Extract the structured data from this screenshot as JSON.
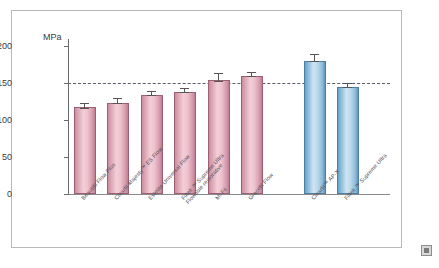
{
  "figure": {
    "corner_icon": "image-placeholder-icon"
  },
  "chart_data": {
    "type": "bar",
    "title": "",
    "xlabel": "",
    "ylabel": "MPa",
    "axis_unit_label": "MPa",
    "ylim": [
      0,
      200
    ],
    "yticks": [
      0,
      50,
      100,
      150,
      200
    ],
    "ytick_labels": [
      "0",
      "50",
      "100",
      "150",
      "200"
    ],
    "grid": false,
    "legend": "none",
    "reference_line": {
      "value": 150,
      "style": "dashed",
      "color": "#5a5a6a",
      "label": ""
    },
    "categories": [
      "Beautifil Flow Plus",
      "Clearfil Majesty™ ES Flow",
      "Estelite Universal Flow",
      "Filtek ™ Supreme Ultra Flowable restorative",
      "MI Fil",
      "Gracefil Flow",
      "Clearfil™ AP-X",
      "Filtek ™ Supreme Ultra"
    ],
    "category_lines": [
      [
        "Beautifil Flow Plus"
      ],
      [
        "Clearfil Majesty™ ES Flow"
      ],
      [
        "Estelite Universal Flow"
      ],
      [
        "Filtek ™ Supreme Ultra",
        "Flowable restorative"
      ],
      [
        "MI Fil"
      ],
      [
        "Gracefil Flow"
      ],
      [
        "Clearfil™ AP-X"
      ],
      [
        "Filtek ™ Supreme Ultra"
      ]
    ],
    "values": [
      117,
      123,
      134,
      138,
      154,
      159,
      180,
      145
    ],
    "errors": [
      6,
      7,
      5,
      5,
      9,
      6,
      9,
      5
    ],
    "bar_colors": [
      "#e0a8b7",
      "#e0a8b7",
      "#e0a8b7",
      "#e0a8b7",
      "#e0a8b7",
      "#e0a8b7",
      "#9ccae4",
      "#9ccae4"
    ],
    "series_groups": [
      {
        "name": "flowable-composites",
        "color": "#e0a8b7",
        "indices": [
          0,
          1,
          2,
          3,
          4,
          5
        ]
      },
      {
        "name": "reference-composites",
        "color": "#9ccae4",
        "indices": [
          6,
          7
        ]
      }
    ]
  }
}
